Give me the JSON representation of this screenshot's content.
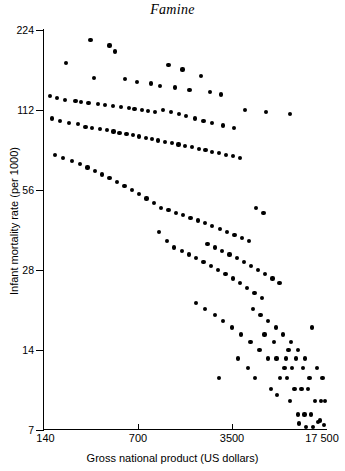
{
  "chart_data": {
    "type": "scatter",
    "title": "Famine",
    "xlabel": "Gross national product (US dollars)",
    "ylabel": "Infant mortality rate (per 1000)",
    "xscale": "log",
    "yscale": "log",
    "xlim": [
      140,
      17500
    ],
    "ylim": [
      7,
      224
    ],
    "xticks": [
      140,
      700,
      3500,
      17500
    ],
    "xticklabels": [
      "140",
      "700",
      "3500",
      "17 500"
    ],
    "yticks": [
      7,
      14,
      28,
      56,
      112,
      224
    ],
    "yticklabels": [
      "7",
      "14",
      "28",
      "56",
      "112",
      "224"
    ],
    "grid": false,
    "legend": null,
    "marker_color": "#000000",
    "points": [
      [
        310,
        205
      ],
      [
        430,
        196
      ],
      [
        470,
        186
      ],
      [
        205,
        168
      ],
      [
        1180,
        165
      ],
      [
        1500,
        159
      ],
      [
        2050,
        150
      ],
      [
        330,
        148
      ],
      [
        560,
        146
      ],
      [
        690,
        143
      ],
      [
        870,
        141
      ],
      [
        1020,
        138
      ],
      [
        1320,
        136
      ],
      [
        1690,
        133
      ],
      [
        2400,
        131
      ],
      [
        2900,
        128
      ],
      [
        155,
        126
      ],
      [
        175,
        124
      ],
      [
        200,
        122
      ],
      [
        240,
        121
      ],
      [
        265,
        120
      ],
      [
        300,
        119
      ],
      [
        355,
        118
      ],
      [
        400,
        117
      ],
      [
        455,
        116
      ],
      [
        520,
        115
      ],
      [
        600,
        114
      ],
      [
        660,
        113
      ],
      [
        745,
        112
      ],
      [
        830,
        111
      ],
      [
        940,
        110
      ],
      [
        1080,
        112
      ],
      [
        1240,
        110
      ],
      [
        1420,
        108
      ],
      [
        1600,
        106
      ],
      [
        1850,
        104
      ],
      [
        2150,
        102
      ],
      [
        2500,
        100
      ],
      [
        3000,
        98
      ],
      [
        3600,
        96
      ],
      [
        4400,
        112
      ],
      [
        6300,
        110
      ],
      [
        9500,
        108
      ],
      [
        160,
        104
      ],
      [
        185,
        102
      ],
      [
        215,
        100
      ],
      [
        250,
        99
      ],
      [
        285,
        97
      ],
      [
        320,
        96
      ],
      [
        365,
        95
      ],
      [
        410,
        94
      ],
      [
        460,
        93
      ],
      [
        510,
        92
      ],
      [
        575,
        91
      ],
      [
        640,
        90
      ],
      [
        715,
        89
      ],
      [
        800,
        88
      ],
      [
        890,
        87
      ],
      [
        990,
        86
      ],
      [
        1110,
        85
      ],
      [
        1250,
        84
      ],
      [
        1400,
        83
      ],
      [
        1570,
        82
      ],
      [
        1760,
        81
      ],
      [
        1980,
        80
      ],
      [
        2220,
        79
      ],
      [
        2500,
        78
      ],
      [
        2800,
        77
      ],
      [
        3150,
        76
      ],
      [
        3550,
        75
      ],
      [
        4000,
        74
      ],
      [
        170,
        76
      ],
      [
        195,
        74
      ],
      [
        225,
        72
      ],
      [
        260,
        70
      ],
      [
        295,
        68
      ],
      [
        335,
        66
      ],
      [
        380,
        64
      ],
      [
        430,
        62
      ],
      [
        490,
        60
      ],
      [
        555,
        58
      ],
      [
        630,
        56
      ],
      [
        715,
        54
      ],
      [
        810,
        52
      ],
      [
        920,
        50
      ],
      [
        1040,
        48
      ],
      [
        1180,
        47
      ],
      [
        1340,
        46
      ],
      [
        1520,
        45
      ],
      [
        1720,
        44
      ],
      [
        1950,
        43
      ],
      [
        2210,
        42
      ],
      [
        2500,
        41
      ],
      [
        2840,
        40
      ],
      [
        3220,
        39
      ],
      [
        3650,
        38
      ],
      [
        4140,
        37
      ],
      [
        4700,
        36
      ],
      [
        5300,
        48
      ],
      [
        6000,
        46
      ],
      [
        1000,
        39
      ],
      [
        1150,
        36
      ],
      [
        1300,
        34
      ],
      [
        1480,
        33
      ],
      [
        1680,
        32
      ],
      [
        1900,
        31
      ],
      [
        2150,
        30
      ],
      [
        2440,
        29
      ],
      [
        2760,
        28
      ],
      [
        3130,
        27
      ],
      [
        3550,
        26
      ],
      [
        4020,
        25
      ],
      [
        4550,
        24
      ],
      [
        5150,
        23
      ],
      [
        5850,
        22
      ],
      [
        2300,
        35
      ],
      [
        2600,
        34
      ],
      [
        2950,
        33
      ],
      [
        3350,
        32
      ],
      [
        3800,
        31
      ],
      [
        4300,
        30
      ],
      [
        4850,
        29
      ],
      [
        5500,
        28
      ],
      [
        6200,
        27
      ],
      [
        7000,
        26
      ],
      [
        7900,
        25
      ],
      [
        1900,
        21
      ],
      [
        2200,
        20
      ],
      [
        2600,
        19
      ],
      [
        3000,
        18
      ],
      [
        3500,
        17
      ],
      [
        4100,
        16
      ],
      [
        4800,
        15
      ],
      [
        5600,
        14
      ],
      [
        6500,
        13
      ],
      [
        7500,
        13
      ],
      [
        8600,
        12
      ],
      [
        9800,
        12
      ],
      [
        5000,
        20
      ],
      [
        5700,
        19
      ],
      [
        6500,
        18
      ],
      [
        7400,
        17
      ],
      [
        8400,
        16
      ],
      [
        9600,
        15
      ],
      [
        10900,
        14
      ],
      [
        12300,
        13
      ],
      [
        8000,
        11
      ],
      [
        9000,
        11
      ],
      [
        10200,
        10
      ],
      [
        11500,
        10
      ],
      [
        12900,
        10
      ],
      [
        14500,
        9
      ],
      [
        16000,
        9
      ],
      [
        9500,
        9
      ],
      [
        10800,
        8
      ],
      [
        12100,
        8
      ],
      [
        13600,
        8
      ],
      [
        15200,
        7.5
      ],
      [
        16800,
        7.3
      ],
      [
        11000,
        7.4
      ],
      [
        12500,
        7.2
      ],
      [
        14000,
        7.2
      ],
      [
        15800,
        7.6
      ],
      [
        17200,
        9
      ],
      [
        16500,
        11
      ],
      [
        15000,
        12
      ],
      [
        13200,
        11
      ],
      [
        11800,
        12
      ],
      [
        10500,
        13
      ],
      [
        6800,
        10
      ],
      [
        7600,
        9.5
      ],
      [
        8800,
        13
      ],
      [
        4600,
        12
      ],
      [
        5200,
        11
      ],
      [
        3900,
        13
      ],
      [
        2800,
        11
      ],
      [
        9200,
        14
      ],
      [
        7200,
        15
      ],
      [
        6100,
        16
      ],
      [
        13800,
        17
      ]
    ]
  }
}
